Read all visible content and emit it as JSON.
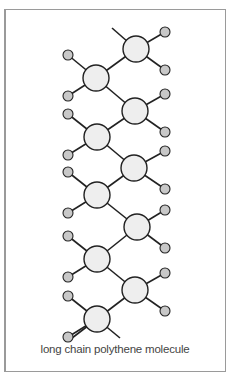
{
  "diagram": {
    "caption": "long chain polythene molecule",
    "colors": {
      "frame": "#9a9a9a",
      "bond": "#222222",
      "carbon_fill": "#eeeeee",
      "hydrogen_fill": "#c8c8c8"
    },
    "carbons": [
      {
        "x": 136,
        "y": 49
      },
      {
        "x": 96,
        "y": 78
      },
      {
        "x": 135,
        "y": 111
      },
      {
        "x": 97,
        "y": 137
      },
      {
        "x": 134,
        "y": 168
      },
      {
        "x": 97,
        "y": 195
      },
      {
        "x": 137,
        "y": 227
      },
      {
        "x": 97,
        "y": 259
      },
      {
        "x": 135,
        "y": 290
      },
      {
        "x": 97,
        "y": 319
      }
    ],
    "chain_ends": [
      {
        "x": 112,
        "y": 28
      },
      {
        "x": 72,
        "y": 338
      },
      {
        "x": 120,
        "y": 338
      }
    ],
    "hydrogen_count": 20
  }
}
